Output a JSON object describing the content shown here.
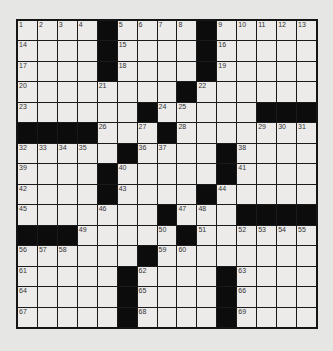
{
  "puzzle": {
    "size": {
      "rows": 15,
      "cols": 15
    },
    "colors": {
      "background": "#e6e6e4",
      "cell": "#ecebea",
      "block": "#0c0c0c",
      "line": "#1a1a1a"
    },
    "layout": [
      "....#....#.....",
      "....#....#.....",
      "....#....#.....",
      "........#......",
      "......#.....###",
      "####...#.......",
      ".....#....#....",
      "....#.....#....",
      "....#....#.....",
      ".......#...####",
      "###.....#......",
      "......#........",
      ".....#....#....",
      ".....#....#....",
      ".....#....#...."
    ],
    "numbers": [
      {
        "r": 0,
        "c": 0,
        "n": "1"
      },
      {
        "r": 0,
        "c": 1,
        "n": "2"
      },
      {
        "r": 0,
        "c": 2,
        "n": "3"
      },
      {
        "r": 0,
        "c": 3,
        "n": "4"
      },
      {
        "r": 0,
        "c": 5,
        "n": "5"
      },
      {
        "r": 0,
        "c": 6,
        "n": "6"
      },
      {
        "r": 0,
        "c": 7,
        "n": "7"
      },
      {
        "r": 0,
        "c": 8,
        "n": "8"
      },
      {
        "r": 0,
        "c": 10,
        "n": "9"
      },
      {
        "r": 0,
        "c": 11,
        "n": "10"
      },
      {
        "r": 0,
        "c": 12,
        "n": "11"
      },
      {
        "r": 0,
        "c": 13,
        "n": "12"
      },
      {
        "r": 0,
        "c": 14,
        "n": "13"
      },
      {
        "r": 1,
        "c": 0,
        "n": "14"
      },
      {
        "r": 1,
        "c": 5,
        "n": "15"
      },
      {
        "r": 1,
        "c": 10,
        "n": "16"
      },
      {
        "r": 2,
        "c": 0,
        "n": "17"
      },
      {
        "r": 2,
        "c": 5,
        "n": "18"
      },
      {
        "r": 2,
        "c": 10,
        "n": "19"
      },
      {
        "r": 3,
        "c": 0,
        "n": "20"
      },
      {
        "r": 3,
        "c": 4,
        "n": "21"
      },
      {
        "r": 3,
        "c": 9,
        "n": "22"
      },
      {
        "r": 4,
        "c": 0,
        "n": "23"
      },
      {
        "r": 4,
        "c": 7,
        "n": "24"
      },
      {
        "r": 4,
        "c": 8,
        "n": "25"
      },
      {
        "r": 5,
        "c": 4,
        "n": "26"
      },
      {
        "r": 5,
        "c": 6,
        "n": "27"
      },
      {
        "r": 5,
        "c": 8,
        "n": "28"
      },
      {
        "r": 5,
        "c": 12,
        "n": "29"
      },
      {
        "r": 5,
        "c": 13,
        "n": "30"
      },
      {
        "r": 5,
        "c": 14,
        "n": "31"
      },
      {
        "r": 6,
        "c": 0,
        "n": "32"
      },
      {
        "r": 6,
        "c": 1,
        "n": "33"
      },
      {
        "r": 6,
        "c": 2,
        "n": "34"
      },
      {
        "r": 6,
        "c": 3,
        "n": "35"
      },
      {
        "r": 6,
        "c": 6,
        "n": "36"
      },
      {
        "r": 6,
        "c": 7,
        "n": "37"
      },
      {
        "r": 6,
        "c": 11,
        "n": "38"
      },
      {
        "r": 7,
        "c": 0,
        "n": "39"
      },
      {
        "r": 7,
        "c": 5,
        "n": "40"
      },
      {
        "r": 7,
        "c": 11,
        "n": "41"
      },
      {
        "r": 8,
        "c": 0,
        "n": "42"
      },
      {
        "r": 8,
        "c": 5,
        "n": "43"
      },
      {
        "r": 8,
        "c": 10,
        "n": "44"
      },
      {
        "r": 9,
        "c": 0,
        "n": "45"
      },
      {
        "r": 9,
        "c": 4,
        "n": "46"
      },
      {
        "r": 9,
        "c": 8,
        "n": "47"
      },
      {
        "r": 9,
        "c": 9,
        "n": "48"
      },
      {
        "r": 10,
        "c": 3,
        "n": "49"
      },
      {
        "r": 10,
        "c": 7,
        "n": "50"
      },
      {
        "r": 10,
        "c": 9,
        "n": "51"
      },
      {
        "r": 10,
        "c": 11,
        "n": "52"
      },
      {
        "r": 10,
        "c": 12,
        "n": "53"
      },
      {
        "r": 10,
        "c": 13,
        "n": "54"
      },
      {
        "r": 10,
        "c": 14,
        "n": "55"
      },
      {
        "r": 11,
        "c": 0,
        "n": "56"
      },
      {
        "r": 11,
        "c": 1,
        "n": "57"
      },
      {
        "r": 11,
        "c": 2,
        "n": "58"
      },
      {
        "r": 11,
        "c": 7,
        "n": "59"
      },
      {
        "r": 11,
        "c": 8,
        "n": "60"
      },
      {
        "r": 12,
        "c": 0,
        "n": "61"
      },
      {
        "r": 12,
        "c": 6,
        "n": "62"
      },
      {
        "r": 12,
        "c": 11,
        "n": "63"
      },
      {
        "r": 13,
        "c": 0,
        "n": "64"
      },
      {
        "r": 13,
        "c": 6,
        "n": "65"
      },
      {
        "r": 13,
        "c": 11,
        "n": "66"
      },
      {
        "r": 14,
        "c": 0,
        "n": "67"
      },
      {
        "r": 14,
        "c": 6,
        "n": "68"
      },
      {
        "r": 14,
        "c": 11,
        "n": "69"
      }
    ]
  }
}
